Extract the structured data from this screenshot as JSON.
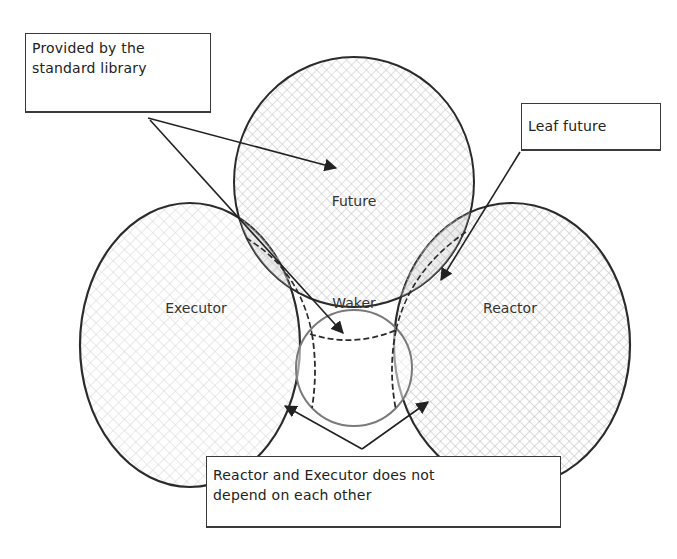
{
  "diagram": {
    "type": "venn-like hand-drawn diagram",
    "circles": {
      "future": {
        "label": "Future"
      },
      "executor": {
        "label": "Executor"
      },
      "reactor": {
        "label": "Reactor"
      },
      "waker": {
        "label": "Waker"
      }
    },
    "annotations": {
      "std_library": {
        "text_line1": "Provided by the",
        "text_line2": "standard library"
      },
      "leaf_future": {
        "text": "Leaf future"
      },
      "independence": {
        "text_line1": "Reactor and Executor does not",
        "text_line2": "depend on each other"
      }
    },
    "colors": {
      "stroke": "#2b2b2b",
      "hatch": "#c8c8c8",
      "waker_stroke": "#7a7a7a",
      "background": "#ffffff"
    }
  }
}
